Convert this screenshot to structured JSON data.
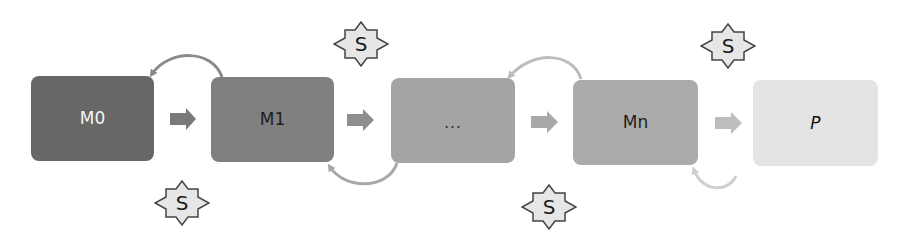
{
  "diagram": {
    "nodes": [
      {
        "id": "M0",
        "label": "M0",
        "fill": "#676767",
        "text_color": "#f4f4f4"
      },
      {
        "id": "M1",
        "label": "M1",
        "fill": "#808080",
        "text_color": "#1e1e1e"
      },
      {
        "id": "dots",
        "label": "...",
        "fill": "#a4a4a4",
        "text_color": "#2a2a2a"
      },
      {
        "id": "Mn",
        "label": "Mn",
        "fill": "#ababab",
        "text_color": "#1e1e1e"
      },
      {
        "id": "P",
        "label": "P",
        "fill": "#e4e4e4",
        "text_color": "#111111",
        "italic": true
      }
    ],
    "forward_arrows": [
      {
        "from": "M0",
        "to": "M1",
        "color": "#7a7a7a"
      },
      {
        "from": "M1",
        "to": "dots",
        "color": "#8e8e8e"
      },
      {
        "from": "dots",
        "to": "Mn",
        "color": "#a8a8a8"
      },
      {
        "from": "Mn",
        "to": "P",
        "color": "#bdbdbd"
      }
    ],
    "feedback_arrows": [
      {
        "from": "M1",
        "to": "M0",
        "position": "top",
        "color": "#8a8a8a"
      },
      {
        "from": "dots",
        "to": "M1",
        "position": "bottom",
        "color": "#a8a8a8"
      },
      {
        "from": "Mn",
        "to": "dots",
        "position": "top",
        "color": "#bcbcbc"
      },
      {
        "from": "Mn-right",
        "to": "Mn",
        "position": "bottom",
        "color": "#cfcfcf"
      }
    ],
    "badges": [
      {
        "label": "S",
        "position": "below",
        "between": [
          "M0",
          "M1"
        ]
      },
      {
        "label": "S",
        "position": "above",
        "between": [
          "M1",
          "dots"
        ]
      },
      {
        "label": "S",
        "position": "below",
        "between": [
          "dots",
          "Mn"
        ]
      },
      {
        "label": "S",
        "position": "above",
        "between": [
          "Mn",
          "P"
        ]
      }
    ],
    "badge_style": {
      "fill": "#e6e6e6",
      "stroke": "#444444",
      "shape": "8-point-star"
    }
  }
}
